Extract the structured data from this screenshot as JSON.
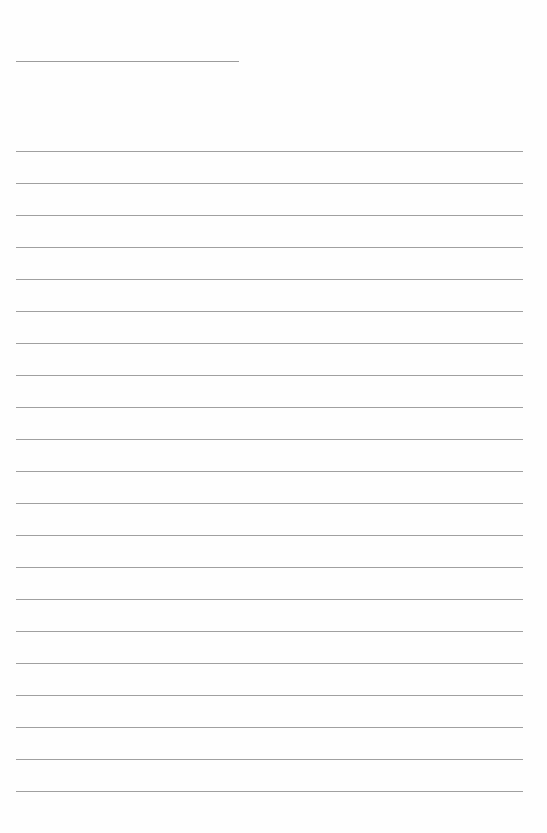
{
  "page": {
    "type": "blank ruled notepaper",
    "header_line": {
      "x": 16,
      "y": 61,
      "width": 223
    },
    "rules": {
      "count": 21,
      "x": 16,
      "width": 507,
      "first_y": 151,
      "spacing": 32
    },
    "colors": {
      "background": "#fefefe",
      "line": "#a0a0a0"
    }
  }
}
